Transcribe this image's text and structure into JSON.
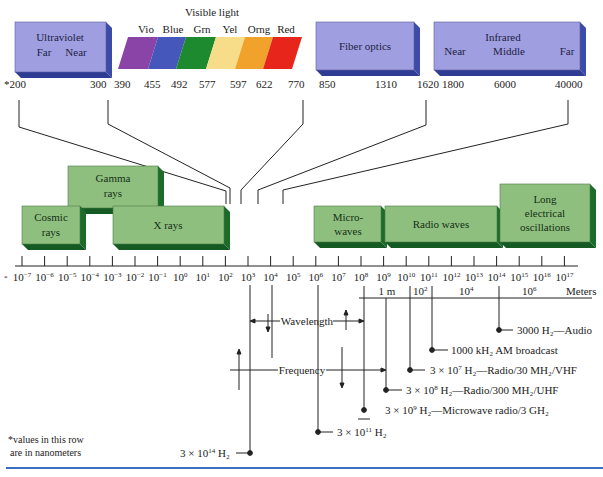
{
  "colors": {
    "uv_box_face": "#9e9ee0",
    "uv_box_side": "#3c4aa8",
    "green_box_face": "#8fbf7f",
    "green_box_side": "#1b6b2a",
    "visible": {
      "Vio": "#8a44a8",
      "Blue": "#4557bb",
      "Grn": "#1e8a30",
      "Yel": "#f7dc8a",
      "Orng": "#f0a22a",
      "Red": "#e8251b"
    },
    "footer_rule": "#3b6fc0"
  },
  "top_row": {
    "ultraviolet": {
      "title": "Ultraviolet",
      "sub_left": "Far",
      "sub_right": "Near",
      "ticks": [
        "*200",
        "300"
      ]
    },
    "visible_light": {
      "title": "Visible light",
      "bands": [
        "Vio",
        "Blue",
        "Grn",
        "Yel",
        "Orng",
        "Red"
      ],
      "ticks": [
        "390",
        "455",
        "492",
        "577",
        "597",
        "622",
        "770"
      ]
    },
    "fiber_optics": {
      "title": "Fiber optics",
      "ticks": [
        "850",
        "1310",
        "1620"
      ]
    },
    "infrared": {
      "title": "Infrared",
      "sub_left": "Near",
      "sub_mid": "Middle",
      "sub_right": "Far",
      "ticks": [
        "1800",
        "6000",
        "40000"
      ]
    }
  },
  "bands": {
    "gamma": {
      "line1": "Gamma",
      "line2": "rays"
    },
    "cosmic": {
      "line1": "Cosmic",
      "line2": "rays"
    },
    "xrays": {
      "line1": "X rays"
    },
    "microwaves": {
      "line1": "Micro-",
      "line2": "waves"
    },
    "radio": {
      "line1": "Radio waves"
    },
    "long": {
      "line1": "Long",
      "line2": "electrical",
      "line3": "oscillations"
    }
  },
  "axis": {
    "asterisk": "*",
    "base": "10",
    "exponents": [
      "−7",
      "−6",
      "−5",
      "−4",
      "−3",
      "−2",
      "−1",
      "0",
      "1",
      "2",
      "3",
      "4",
      "5",
      "6",
      "7",
      "8",
      "9",
      "10",
      "11",
      "12",
      "13",
      "14",
      "15",
      "16",
      "17"
    ]
  },
  "meters_row": {
    "one_m": "1 m",
    "e2_base": "10",
    "e2_exp": "2",
    "e4_base": "10",
    "e4_exp": "4",
    "e6_base": "10",
    "e6_exp": "6",
    "unit": "Meters"
  },
  "legend": {
    "wavelength": "Wavelength",
    "frequency": "Frequency"
  },
  "frequencies": {
    "audio": "3000 H₂—Audio",
    "am": "1000 kH₂ AM broadcast",
    "vhf_pre": "3 × 10",
    "vhf_exp": "7",
    "vhf_post": " H₂—Radio/30 MH₂/VHF",
    "uhf_pre": "3 × 10",
    "uhf_exp": "8",
    "uhf_post": " H₂—Radio/300 MH₂/UHF",
    "micro_pre": "3 × 10",
    "micro_exp": "9",
    "micro_post": " H₂—Microwave radio/3 GH₂",
    "f11_pre": "3 × 10",
    "f11_exp": "11",
    "f11_post": " H₂",
    "f14_pre": "3 × 10",
    "f14_exp": "14",
    "f14_post": " H₂"
  },
  "footnote": {
    "line1": "*values in this row",
    "line2": "are in nanometers"
  }
}
